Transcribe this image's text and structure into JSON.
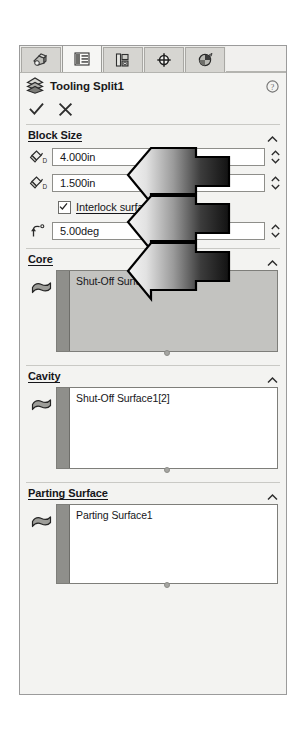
{
  "panel": {
    "kind": "property-manager",
    "tabs": [
      {
        "id": "feature-manager-tree",
        "label": "FeatureManager Design Tree",
        "active": false
      },
      {
        "id": "property-manager",
        "label": "PropertyManager",
        "active": true
      },
      {
        "id": "configuration-manager",
        "label": "ConfigurationManager",
        "active": false
      },
      {
        "id": "dimxpert-manager",
        "label": "DimXpertManager",
        "active": false
      },
      {
        "id": "display-manager",
        "label": "DisplayManager",
        "active": false
      }
    ],
    "header": {
      "title": "Tooling Split1",
      "icon": "tooling-split-icon",
      "help_icon": "help-icon",
      "help_label": "?"
    },
    "actions": {
      "ok_label": "✓",
      "ok_name": "check-icon",
      "cancel_label": "✕",
      "cancel_name": "close-icon"
    },
    "sections": [
      {
        "id": "block-size",
        "title": "Block Size",
        "title_mnemonic": "B",
        "collapsed": false,
        "fields": [
          {
            "id": "block-depth-core",
            "icon": "depth-direction-1-icon",
            "value": "4.000in",
            "spinner": true
          },
          {
            "id": "block-depth-cavity",
            "icon": "depth-direction-2-icon",
            "value": "1.500in",
            "spinner": true
          }
        ],
        "checkbox": {
          "id": "interlock-surface",
          "label": "Interlock surface",
          "mnemonic": "I",
          "checked": true
        },
        "angle_field": {
          "id": "draft-angle",
          "icon": "draft-angle-icon",
          "value": "5.00deg",
          "spinner": true
        }
      },
      {
        "id": "core",
        "title": "Core",
        "title_mnemonic": "C",
        "collapsed": false,
        "icon": "surface-face-icon",
        "active": true,
        "items": [
          "Shut-Off Surface1[1]"
        ]
      },
      {
        "id": "cavity",
        "title": "Cavity",
        "title_mnemonic": "a",
        "collapsed": false,
        "icon": "surface-face-icon",
        "active": false,
        "items": [
          "Shut-Off Surface1[2]"
        ]
      },
      {
        "id": "parting-surface",
        "title": "Parting Surface",
        "title_mnemonic": "P",
        "collapsed": false,
        "icon": "surface-face-icon",
        "active": false,
        "items": [
          "Parting Surface1"
        ]
      }
    ]
  },
  "annotation": {
    "kind": "callout-arrow",
    "description": "Three-headed black gradient arrow pointing left at the Block Size value fields",
    "heads": 3,
    "fill_from": "#f2f2f2",
    "fill_to": "#141414",
    "stroke": "#000000"
  },
  "colors": {
    "panel_bg": "#f3f3f1",
    "panel_border": "#9b9b9b",
    "tab_inactive": "#d6d5d1",
    "tab_active": "#f6f6f4",
    "input_bg": "#ffffff",
    "input_border": "#8e8e8a",
    "selbox_active_bg": "#c3c3c0",
    "gutter": "#8f8f8b",
    "text": "#16161a"
  }
}
